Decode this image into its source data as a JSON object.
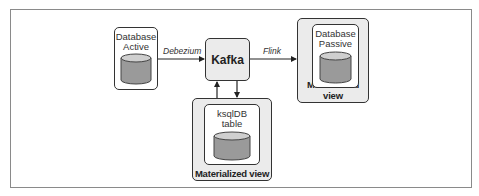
{
  "diagram": {
    "nodes": {
      "db_active": {
        "label_line1": "Database",
        "label_line2": "Active"
      },
      "kafka": {
        "label": "Kafka"
      },
      "db_passive": {
        "label_line1": "Database",
        "label_line2": "Passive",
        "container_label": "Materialized view"
      },
      "ksqldb": {
        "label_line1": "ksqlDB",
        "label_line2": "table",
        "container_label": "Materialized view"
      }
    },
    "edges": [
      {
        "from": "db_active",
        "to": "kafka",
        "label": "Debezium"
      },
      {
        "from": "kafka",
        "to": "db_passive",
        "label": "Flink"
      },
      {
        "from": "kafka",
        "to": "ksqldb",
        "label": ""
      },
      {
        "from": "ksqldb",
        "to": "kafka",
        "label": ""
      }
    ],
    "colors": {
      "cylinder_fill": "#9a9a9a",
      "container_fill": "#ebebeb",
      "stroke": "#333333"
    }
  }
}
